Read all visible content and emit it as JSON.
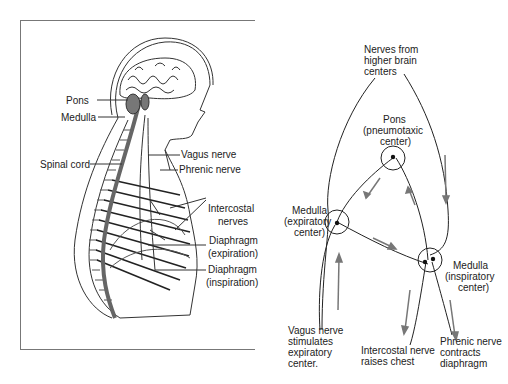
{
  "left_panel": {
    "labels": {
      "pons": "Pons",
      "medulla": "Medulla",
      "spinal_cord": "Spinal cord",
      "vagus_nerve": "Vagus nerve",
      "phrenic_nerve": "Phrenic nerve",
      "intercostal_1": "Intercostal",
      "intercostal_2": "nerves",
      "diaphragm_exp_1": "Diaphragm",
      "diaphragm_exp_2": "(expiration)",
      "diaphragm_insp_1": "Diaphragm",
      "diaphragm_insp_2": "(inspiration)"
    }
  },
  "right_panel": {
    "labels": {
      "higher_1": "Nerves from",
      "higher_2": "higher brain",
      "higher_3": "centers",
      "pons_1": "Pons",
      "pons_2": "(pneumotaxic",
      "pons_3": "center)",
      "med_exp_1": "Medulla",
      "med_exp_2": "(expiratory",
      "med_exp_3": "center)",
      "med_insp_1": "Medulla",
      "med_insp_2": "(inspiratory",
      "med_insp_3": "center)",
      "vagus_1": "Vagus nerve",
      "vagus_2": "stimulates",
      "vagus_3": "expiratory",
      "vagus_4": "center.",
      "intercostal_1": "Intercostal nerve",
      "intercostal_2": "raises chest",
      "phrenic_1": "Phrenic nerve",
      "phrenic_2": "contracts",
      "phrenic_3": "diaphragm"
    }
  },
  "colors": {
    "line": "#222222",
    "arrow": "#777777",
    "cord": "#666666"
  }
}
